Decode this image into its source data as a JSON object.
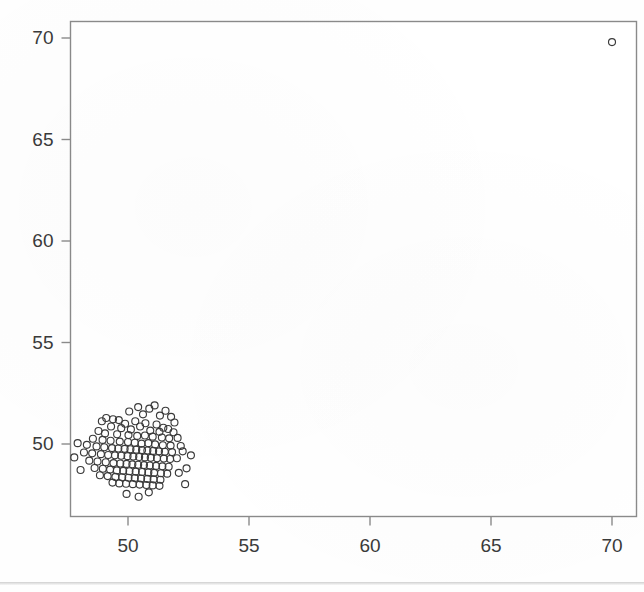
{
  "figure": {
    "background_color": "#fefefe",
    "frame_color": "#8a8a8a",
    "marker_color": "#3a3a3a",
    "label_color": "#3a3a3a"
  },
  "axes": {
    "x_ticks": [
      "50",
      "55",
      "60",
      "65",
      "70"
    ],
    "y_ticks": [
      "50",
      "55",
      "60",
      "65",
      "70"
    ],
    "x_title": "",
    "y_title": ""
  },
  "chart_data": {
    "type": "scatter",
    "title": "",
    "xlabel": "",
    "ylabel": "",
    "xlim": [
      47.4,
      70.9
    ],
    "ylim": [
      46.8,
      70.6
    ],
    "xticks": [
      50,
      55,
      60,
      65,
      70
    ],
    "yticks": [
      50,
      55,
      60,
      65,
      70
    ],
    "grid": false,
    "legend": false,
    "marker": "open-circle",
    "marker_size_px": 7,
    "series": [
      {
        "name": "observations",
        "n_points": 131,
        "cluster_center": [
          50.45,
          49.75
        ],
        "cluster_spread": [
          0.85,
          0.85
        ],
        "points": [
          [
            50.42,
            51.82
          ],
          [
            50.88,
            51.74
          ],
          [
            51.1,
            51.9
          ],
          [
            50.05,
            51.6
          ],
          [
            51.55,
            51.64
          ],
          [
            51.32,
            51.4
          ],
          [
            50.62,
            51.46
          ],
          [
            49.1,
            51.28
          ],
          [
            49.38,
            51.22
          ],
          [
            49.62,
            51.18
          ],
          [
            48.92,
            51.12
          ],
          [
            51.78,
            51.34
          ],
          [
            51.92,
            51.06
          ],
          [
            50.3,
            51.12
          ],
          [
            50.72,
            51.02
          ],
          [
            51.18,
            50.96
          ],
          [
            49.88,
            51.0
          ],
          [
            50.5,
            50.86
          ],
          [
            51.46,
            50.8
          ],
          [
            51.66,
            50.74
          ],
          [
            49.3,
            50.86
          ],
          [
            49.72,
            50.78
          ],
          [
            50.12,
            50.72
          ],
          [
            50.92,
            50.66
          ],
          [
            51.3,
            50.6
          ],
          [
            51.88,
            50.58
          ],
          [
            48.78,
            50.64
          ],
          [
            49.05,
            50.52
          ],
          [
            49.55,
            50.48
          ],
          [
            50.02,
            50.44
          ],
          [
            50.38,
            50.4
          ],
          [
            50.7,
            50.42
          ],
          [
            51.02,
            50.36
          ],
          [
            51.4,
            50.32
          ],
          [
            51.7,
            50.28
          ],
          [
            52.05,
            50.3
          ],
          [
            48.55,
            50.26
          ],
          [
            48.95,
            50.2
          ],
          [
            49.28,
            50.16
          ],
          [
            49.66,
            50.12
          ],
          [
            50.0,
            50.1
          ],
          [
            50.28,
            50.06
          ],
          [
            50.56,
            50.02
          ],
          [
            50.84,
            50.04
          ],
          [
            51.12,
            49.98
          ],
          [
            51.44,
            49.94
          ],
          [
            51.76,
            49.92
          ],
          [
            52.18,
            49.9
          ],
          [
            47.92,
            50.04
          ],
          [
            48.3,
            49.96
          ],
          [
            48.7,
            49.88
          ],
          [
            49.02,
            49.84
          ],
          [
            49.34,
            49.8
          ],
          [
            49.6,
            49.78
          ],
          [
            49.86,
            49.76
          ],
          [
            50.1,
            49.74
          ],
          [
            50.34,
            49.72
          ],
          [
            50.58,
            49.7
          ],
          [
            50.8,
            49.68
          ],
          [
            51.04,
            49.66
          ],
          [
            51.28,
            49.64
          ],
          [
            51.52,
            49.62
          ],
          [
            51.82,
            49.6
          ],
          [
            52.26,
            49.64
          ],
          [
            48.18,
            49.58
          ],
          [
            48.52,
            49.54
          ],
          [
            48.88,
            49.5
          ],
          [
            49.18,
            49.46
          ],
          [
            49.46,
            49.44
          ],
          [
            49.72,
            49.42
          ],
          [
            49.98,
            49.4
          ],
          [
            50.22,
            49.38
          ],
          [
            50.46,
            49.36
          ],
          [
            50.7,
            49.34
          ],
          [
            50.94,
            49.32
          ],
          [
            51.2,
            49.3
          ],
          [
            51.48,
            49.28
          ],
          [
            51.74,
            49.26
          ],
          [
            52.02,
            49.3
          ],
          [
            47.78,
            49.34
          ],
          [
            48.4,
            49.18
          ],
          [
            48.74,
            49.14
          ],
          [
            49.08,
            49.1
          ],
          [
            49.4,
            49.06
          ],
          [
            49.68,
            49.04
          ],
          [
            49.94,
            49.02
          ],
          [
            50.18,
            49.0
          ],
          [
            50.42,
            48.98
          ],
          [
            50.66,
            48.96
          ],
          [
            50.9,
            48.94
          ],
          [
            51.16,
            48.92
          ],
          [
            51.42,
            48.9
          ],
          [
            51.68,
            48.88
          ],
          [
            48.62,
            48.82
          ],
          [
            48.96,
            48.78
          ],
          [
            49.26,
            48.74
          ],
          [
            49.54,
            48.7
          ],
          [
            49.8,
            48.68
          ],
          [
            50.06,
            48.66
          ],
          [
            50.32,
            48.64
          ],
          [
            50.58,
            48.62
          ],
          [
            50.84,
            48.6
          ],
          [
            51.08,
            48.58
          ],
          [
            51.36,
            48.56
          ],
          [
            51.62,
            48.54
          ],
          [
            52.1,
            48.58
          ],
          [
            48.84,
            48.46
          ],
          [
            49.16,
            48.42
          ],
          [
            49.48,
            48.38
          ],
          [
            49.76,
            48.36
          ],
          [
            50.02,
            48.34
          ],
          [
            50.28,
            48.32
          ],
          [
            50.54,
            48.3
          ],
          [
            50.8,
            48.28
          ],
          [
            51.06,
            48.26
          ],
          [
            51.34,
            48.24
          ],
          [
            49.36,
            48.1
          ],
          [
            49.64,
            48.06
          ],
          [
            49.92,
            48.04
          ],
          [
            50.2,
            48.02
          ],
          [
            50.48,
            48.0
          ],
          [
            50.76,
            47.98
          ],
          [
            51.02,
            47.96
          ],
          [
            51.3,
            47.94
          ],
          [
            52.42,
            48.8
          ],
          [
            52.36,
            48.02
          ],
          [
            49.94,
            47.54
          ],
          [
            50.44,
            47.4
          ],
          [
            50.86,
            47.62
          ],
          [
            48.04,
            48.72
          ],
          [
            52.6,
            49.44
          ]
        ]
      },
      {
        "name": "outlier",
        "n_points": 1,
        "points": [
          [
            70.0,
            69.8
          ]
        ]
      }
    ]
  }
}
